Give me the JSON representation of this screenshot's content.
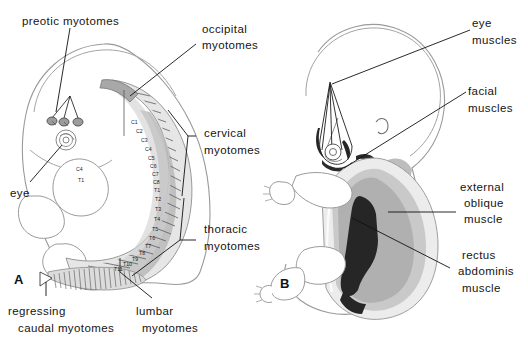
{
  "figure": {
    "panels": [
      {
        "id": "A",
        "letter": "A"
      },
      {
        "id": "B",
        "letter": "B"
      }
    ]
  },
  "panel_a": {
    "letter": "A",
    "labels": {
      "preotic": "preotic  myotomes",
      "occipital_l1": "occipital",
      "occipital_l2": "myotomes",
      "cervical_l1": "cervical",
      "cervical_l2": "myotomes",
      "thoracic_l1": "thoracic",
      "thoracic_l2": "myotomes",
      "eye": "eye",
      "regressing_l1": "regressing",
      "regressing_l2": "caudal  myotomes",
      "lumbar_l1": "lumbar",
      "lumbar_l2": "myotomes"
    },
    "segment_labels": [
      "C1",
      "C2",
      "C3",
      "C4",
      "C5",
      "C6",
      "C7",
      "C8",
      "T1",
      "T2",
      "T3",
      "T4",
      "T5",
      "T6",
      "T7",
      "T8",
      "T9",
      "T10",
      "T11"
    ],
    "extra_segment_labels": [
      "C4",
      "T1"
    ]
  },
  "panel_b": {
    "letter": "B",
    "labels": {
      "eye_l1": "eye",
      "eye_l2": "muscles",
      "facial_l1": "facial",
      "facial_l2": "muscles",
      "external_oblique_l1": "external",
      "external_oblique_l2": "oblique",
      "external_oblique_l3": "muscle",
      "rectus_l1": "rectus",
      "rectus_l2": "abdominis",
      "rectus_l3": "muscle"
    }
  },
  "colors": {
    "ink": "#141414",
    "outline": "#8a8a8a",
    "myotome_light": "#e3e3e3",
    "myotome_mid": "#c2c2c2",
    "myotome_dark": "#9f9f9f",
    "muscle_dark": "#2e2e2e",
    "muscle_mid": "#b8b8b8",
    "muscle_light": "#dadada",
    "background": "#ffffff"
  }
}
